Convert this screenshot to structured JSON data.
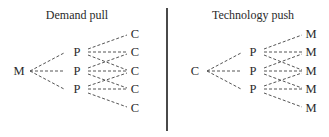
{
  "panels": [
    {
      "title": "Demand pull",
      "root": "M",
      "middle": [
        "P",
        "P",
        "P"
      ],
      "leaves": [
        "C",
        "C",
        "C",
        "C",
        "C"
      ]
    },
    {
      "title": "Technology push",
      "root": "C",
      "middle": [
        "P",
        "P",
        "P"
      ],
      "leaves": [
        "M",
        "M",
        "M",
        "M",
        "M"
      ]
    }
  ],
  "style": {
    "line_color": "#555555",
    "divider_color": "#4a4a4a"
  }
}
